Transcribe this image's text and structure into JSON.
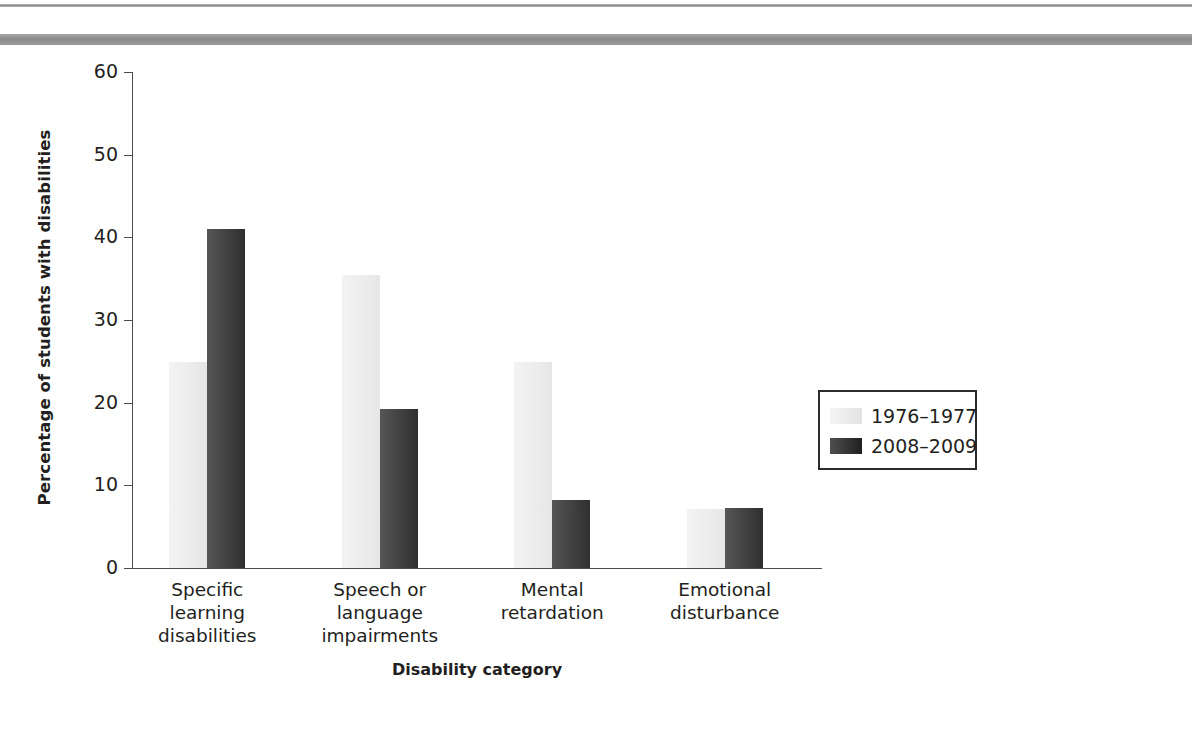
{
  "figure": {
    "top_rule_color": "#8e8e8e",
    "background": "#ffffff"
  },
  "chart_data": {
    "type": "bar",
    "title": "",
    "xlabel": "Disability category",
    "ylabel": "Percentage of students with disabilities",
    "categories": [
      "Specific learning disabilities",
      "Speech or language impairments",
      "Mental retardation",
      "Emotional disturbance"
    ],
    "category_lines": [
      [
        "Specific",
        "learning",
        "disabilities"
      ],
      [
        "Speech or",
        "language",
        "impairments"
      ],
      [
        "Mental",
        "retardation"
      ],
      [
        "Emotional",
        "disturbance"
      ]
    ],
    "series": [
      {
        "name": "1976–1977",
        "color": "#ececec",
        "values": [
          24.9,
          35.5,
          24.9,
          7.1
        ]
      },
      {
        "name": "2008–2009",
        "color": "#3a3a3a",
        "values": [
          41.0,
          19.2,
          8.2,
          7.2
        ]
      }
    ],
    "ylim": [
      0,
      60
    ],
    "yticks": [
      0,
      10,
      20,
      30,
      40,
      50,
      60
    ],
    "ytick_labels": [
      "0",
      "10",
      "20",
      "30",
      "40",
      "50",
      "60"
    ],
    "grid": false,
    "legend_position": "right-middle",
    "legend_entries": [
      "1976–1977",
      "2008–2009"
    ]
  }
}
